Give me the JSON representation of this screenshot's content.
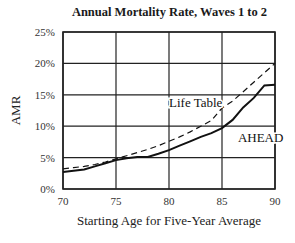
{
  "chart_data": {
    "type": "line",
    "title": "Annual Mortality Rate, Waves 1 to 2",
    "xlabel": "Starting Age for Five-Year Average",
    "ylabel": "AMR",
    "xlim": [
      70,
      90
    ],
    "ylim": [
      0,
      25
    ],
    "x_ticks": [
      "70",
      "75",
      "80",
      "85",
      "90"
    ],
    "y_ticks": [
      "0%",
      "5%",
      "10%",
      "15%",
      "20%",
      "25%"
    ],
    "grid": true,
    "legend": "inline labels",
    "series": [
      {
        "name": "Life Table",
        "style": "dashed",
        "x": [
          70,
          71,
          72,
          73,
          74,
          75,
          76,
          77,
          78,
          79,
          80,
          81,
          82,
          83,
          84,
          85,
          86,
          87,
          88,
          89,
          90
        ],
        "values": [
          3.2,
          3.4,
          3.6,
          3.9,
          4.3,
          4.8,
          5.3,
          5.8,
          6.3,
          6.9,
          7.6,
          8.3,
          9.1,
          10.0,
          10.9,
          12.9,
          14.0,
          15.5,
          17.0,
          18.5,
          20.0
        ]
      },
      {
        "name": "AHEAD",
        "style": "solid",
        "x": [
          70,
          71,
          72,
          73,
          74,
          75,
          76,
          77,
          78,
          79,
          80,
          81,
          82,
          83,
          84,
          85,
          86,
          87,
          88,
          89,
          90
        ],
        "values": [
          2.7,
          2.9,
          3.1,
          3.6,
          4.1,
          4.6,
          4.9,
          5.1,
          5.1,
          5.6,
          6.2,
          6.9,
          7.6,
          8.3,
          8.9,
          9.7,
          11.0,
          13.0,
          14.5,
          16.5,
          16.6
        ]
      }
    ],
    "annotations": [
      {
        "text": "Life Table",
        "x": 80,
        "y": 13
      },
      {
        "text": "AHEAD",
        "x": 86.5,
        "y": 7.5
      }
    ]
  }
}
